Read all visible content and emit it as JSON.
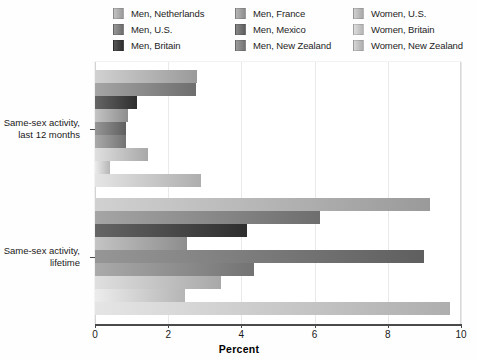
{
  "chart_data": {
    "type": "bar",
    "orientation": "horizontal",
    "title": "",
    "xlabel": "Percent",
    "ylabel": "",
    "xlim": [
      0,
      10
    ],
    "xticks": [
      0,
      2,
      4,
      6,
      8,
      10
    ],
    "xtick_labels": [
      "0",
      "2",
      "4",
      "6",
      "8",
      "10"
    ],
    "grid": true,
    "grid_axis": "x",
    "legend_position": "top",
    "legend_columns": 3,
    "categories": [
      "Same-sex activity, last 12 months",
      "Same-sex activity, lifetime"
    ],
    "category_labels_multiline": [
      [
        "Same-sex activity,",
        "last 12 months"
      ],
      [
        "Same-sex activity,",
        "lifetime"
      ]
    ],
    "series": [
      {
        "name": "Men, Netherlands",
        "color": "#9a9a9a",
        "values": [
          2.8,
          9.15
        ]
      },
      {
        "name": "Men, U.S.",
        "color": "#6e6e6e",
        "values": [
          2.75,
          6.15
        ]
      },
      {
        "name": "Men, Britain",
        "color": "#2e2e2e",
        "values": [
          1.15,
          4.15
        ]
      },
      {
        "name": "Men, France",
        "color": "#8d8d8d",
        "values": [
          0.9,
          2.5
        ]
      },
      {
        "name": "Men, Mexico",
        "color": "#5f5f5f",
        "values": [
          0.85,
          9.0
        ]
      },
      {
        "name": "Men, New Zealand",
        "color": "#737373",
        "values": [
          0.85,
          4.35
        ]
      },
      {
        "name": "Women, U.S.",
        "color": "#a8a8a8",
        "values": [
          1.45,
          3.45
        ]
      },
      {
        "name": "Women, Britain",
        "color": "#b5b5b5",
        "values": [
          0.4,
          2.45
        ]
      },
      {
        "name": "Women, New Zealand",
        "color": "#aeaeae",
        "values": [
          2.9,
          9.7
        ]
      }
    ]
  },
  "legend": {
    "columns": [
      [
        {
          "label": "Men, Netherlands",
          "swatch": "#9a9a9a"
        },
        {
          "label": "Men, U.S.",
          "swatch": "#6e6e6e"
        },
        {
          "label": "Men, Britain",
          "swatch": "#2e2e2e"
        }
      ],
      [
        {
          "label": "Men, France",
          "swatch": "#8d8d8d"
        },
        {
          "label": "Men, Mexico",
          "swatch": "#5f5f5f"
        },
        {
          "label": "Men, New Zealand",
          "swatch": "#737373"
        }
      ],
      [
        {
          "label": "Women, U.S.",
          "swatch": "#a8a8a8"
        },
        {
          "label": "Women, Britain",
          "swatch": "#b5b5b5"
        },
        {
          "label": "Women, New Zealand",
          "swatch": "#aeaeae"
        }
      ]
    ]
  },
  "axis": {
    "x_title": "Percent"
  }
}
